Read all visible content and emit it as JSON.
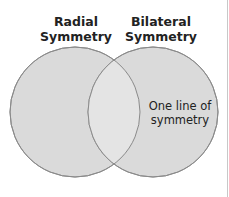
{
  "diagram": {
    "type": "venn",
    "sets": [
      {
        "id": "radial",
        "label_line1": "Radial",
        "label_line2": "Symmetry",
        "fill": "#dcdcdc"
      },
      {
        "id": "bilateral",
        "label_line1": "Bilateral",
        "label_line2": "Symmetry",
        "fill": "#dcdcdc"
      }
    ],
    "regions": {
      "radial_only": "",
      "overlap": "",
      "bilateral_only_line1": "One line of",
      "bilateral_only_line2": "symmetry"
    },
    "colors": {
      "circle_fill": "#dcdcdc",
      "overlap_fill": "#e6e6e6",
      "stroke": "#8a8a8a",
      "text": "#222222"
    }
  }
}
